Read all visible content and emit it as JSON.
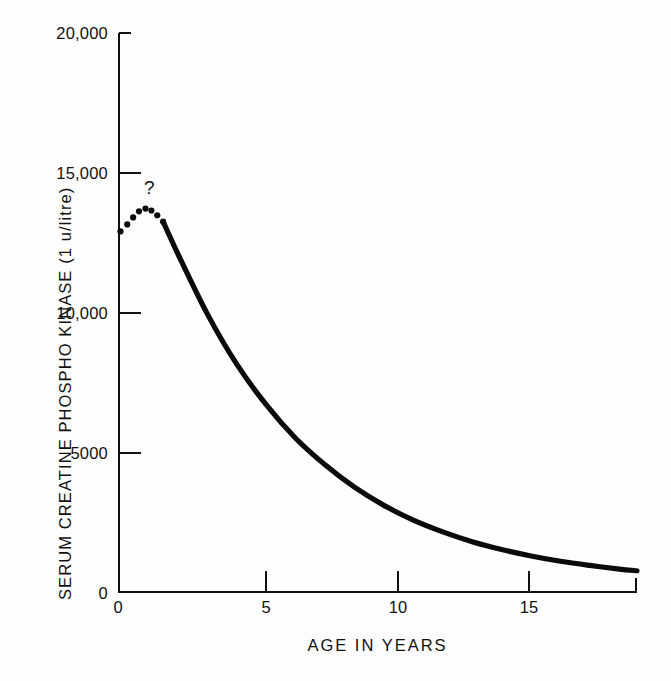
{
  "chart_data": {
    "type": "line",
    "title": "",
    "xlabel": "AGE IN YEARS",
    "ylabel": "SERUM CREATINE PHOSPHO KINASE  (1 u/litre)",
    "xlim": [
      0,
      17.6
    ],
    "ylim": [
      0,
      20000
    ],
    "xticks": [
      0,
      5,
      10,
      15
    ],
    "xtick_labels": [
      "0",
      "5",
      "10",
      "15"
    ],
    "yticks": [
      0,
      5000,
      10000,
      15000,
      20000
    ],
    "ytick_labels": [
      "0",
      "5000",
      "10,000",
      "15,000",
      "20,000"
    ],
    "grid": false,
    "legend": null,
    "annotations": [
      {
        "name": "uncertainty-marker",
        "text": "?",
        "x": 1.1,
        "y": 15000,
        "note": "question mark above the dotted, uncertain early-peak segment"
      }
    ],
    "series": [
      {
        "name": "Serum CPK (dotted, uncertain early rise)",
        "style": "dotted",
        "x": [
          0.05,
          0.28,
          0.48,
          0.68,
          0.9,
          1.1,
          1.3,
          1.5
        ],
        "values": [
          12900,
          13150,
          13400,
          13620,
          13720,
          13650,
          13480,
          13250
        ]
      },
      {
        "name": "Serum CPK (solid, observed decline)",
        "style": "solid",
        "x": [
          1.5,
          2,
          3,
          4,
          5,
          6,
          7,
          8,
          9,
          10,
          11,
          12,
          13,
          14,
          15,
          16,
          17,
          17.6
        ],
        "values": [
          13250,
          12100,
          9950,
          8150,
          6700,
          5500,
          4550,
          3750,
          3100,
          2570,
          2150,
          1800,
          1520,
          1290,
          1100,
          950,
          820,
          760
        ]
      }
    ]
  }
}
